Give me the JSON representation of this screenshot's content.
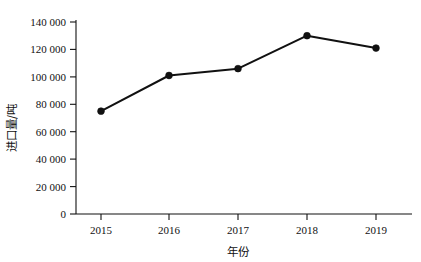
{
  "chart_data": {
    "type": "line",
    "title": "",
    "xlabel": "年份",
    "ylabel": "进口量/吨",
    "categories": [
      "2015",
      "2016",
      "2017",
      "2018",
      "2019"
    ],
    "values": [
      75000,
      101000,
      106000,
      130000,
      121000
    ],
    "series": [
      {
        "name": "进口量",
        "values": [
          75000,
          101000,
          106000,
          130000,
          121000
        ]
      }
    ],
    "ylim": [
      0,
      140000
    ],
    "ytick_labels": [
      "0",
      "20 000",
      "40 000",
      "60 000",
      "80 000",
      "100 000",
      "120 000",
      "140 000"
    ],
    "ytick_values": [
      0,
      20000,
      40000,
      60000,
      80000,
      100000,
      120000,
      140000
    ],
    "xtick_labels": [
      "2015",
      "2016",
      "2017",
      "2018",
      "2019"
    ],
    "grid": false,
    "legend": "none",
    "marker": "filled-circle",
    "line_color": "#111111",
    "marker_color": "#111111",
    "background_color": "#ffffff"
  },
  "axis": {
    "y_title": "进口量/吨",
    "x_title": "年份",
    "y_labels": {
      "t0": "0",
      "t1": "20 000",
      "t2": "40 000",
      "t3": "60 000",
      "t4": "80 000",
      "t5": "100 000",
      "t6": "120 000",
      "t7": "140 000"
    },
    "x_labels": {
      "c0": "2015",
      "c1": "2016",
      "c2": "2017",
      "c3": "2018",
      "c4": "2019"
    }
  }
}
